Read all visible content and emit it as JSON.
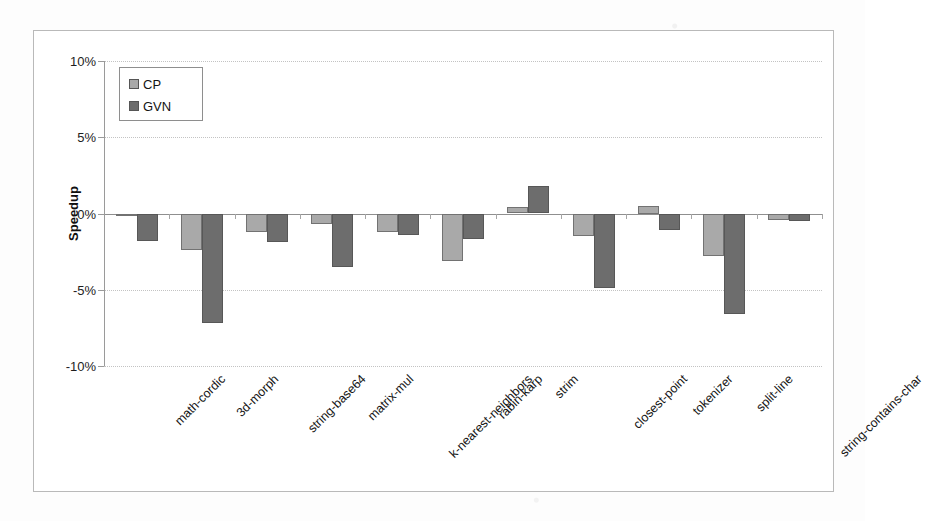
{
  "chart_data": {
    "type": "bar",
    "title": "",
    "subtitle": "",
    "xlabel": "",
    "ylabel": "Speedup",
    "ylim": [
      -10,
      10
    ],
    "ytick_labels": [
      "10%",
      "5%",
      "0%",
      "-5%",
      "-10%"
    ],
    "ytick_values": [
      10,
      5,
      0,
      -5,
      -10
    ],
    "grid": true,
    "legend_position": "top-left",
    "units": "%",
    "categories": [
      "math-cordic",
      "3d-morph",
      "string-base64",
      "matrix-mul",
      "k-nearest-neighbors",
      "rabin-karp",
      "strim",
      "closest-point",
      "tokenizer",
      "split-line",
      "string-contains-char"
    ],
    "series": [
      {
        "name": "CP",
        "color": "#a9a9a9",
        "values": [
          -0.1,
          -2.4,
          -1.2,
          -0.7,
          -1.2,
          -3.1,
          0.4,
          -1.5,
          0.5,
          -2.8,
          -0.4
        ]
      },
      {
        "name": "GVN",
        "color": "#6d6d6d",
        "values": [
          -1.8,
          -7.2,
          -1.9,
          -3.5,
          -1.4,
          -1.7,
          1.8,
          -4.9,
          -1.1,
          -6.6,
          -0.5
        ]
      }
    ]
  },
  "legend": {
    "entries": [
      {
        "label": "CP",
        "swatch": "cp"
      },
      {
        "label": "GVN",
        "swatch": "gvn"
      }
    ]
  }
}
